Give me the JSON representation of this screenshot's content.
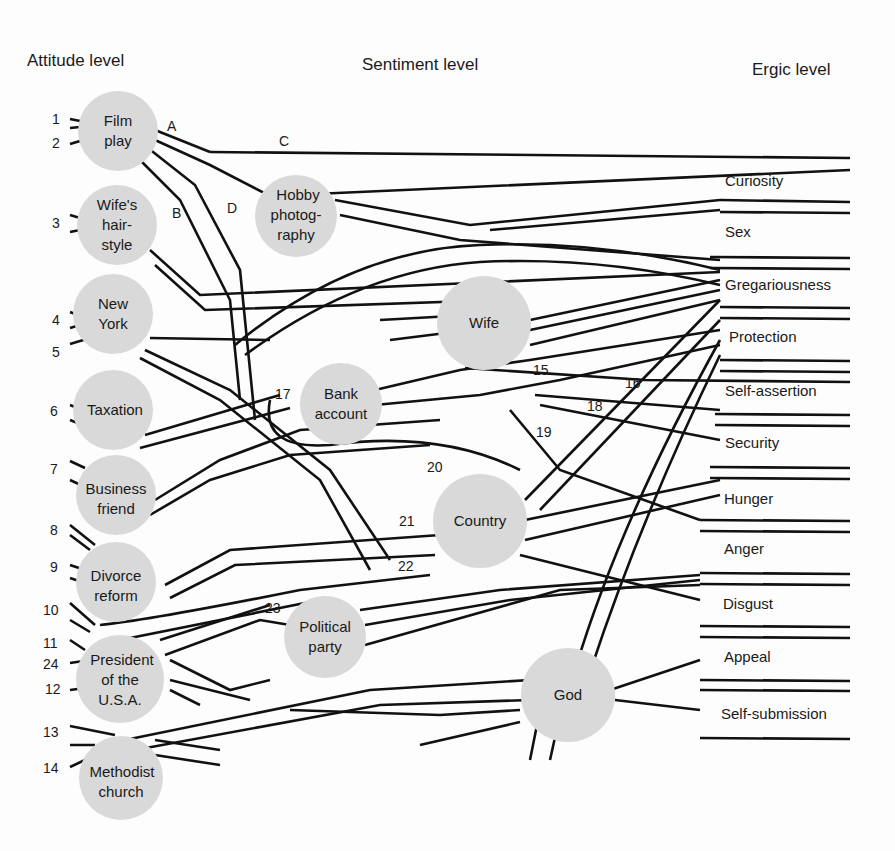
{
  "headers": {
    "attitude": "Attitude level",
    "sentiment": "Sentiment level",
    "ergic": "Ergic level"
  },
  "colors": {
    "node_fill": "#d9d9d9",
    "line": "#111111",
    "background": "#fdfdfd"
  },
  "attitudes": [
    {
      "id": "film",
      "lines": [
        "Film",
        "play"
      ],
      "numbers": [
        "1",
        "2"
      ]
    },
    {
      "id": "wifehair",
      "lines": [
        "Wife's",
        "hair-",
        "style"
      ],
      "numbers": [
        "3"
      ]
    },
    {
      "id": "newyork",
      "lines": [
        "New",
        "York"
      ],
      "numbers": [
        "4",
        "5"
      ]
    },
    {
      "id": "taxation",
      "lines": [
        "Taxation"
      ],
      "numbers": [
        "6"
      ]
    },
    {
      "id": "business",
      "lines": [
        "Business",
        "friend"
      ],
      "numbers": [
        "7"
      ]
    },
    {
      "id": "divorce",
      "lines": [
        "Divorce",
        "reform"
      ],
      "numbers": [
        "8",
        "9"
      ]
    },
    {
      "id": "president",
      "lines": [
        "President",
        "of the",
        "U.S.A."
      ],
      "numbers": [
        "10",
        "11",
        "24",
        "12"
      ]
    },
    {
      "id": "methodist",
      "lines": [
        "Methodist",
        "church"
      ],
      "numbers": [
        "13",
        "14"
      ]
    }
  ],
  "sentiments": [
    {
      "id": "hobby",
      "lines": [
        "Hobby",
        "photog-",
        "raphy"
      ]
    },
    {
      "id": "bank",
      "lines": [
        "Bank",
        "account"
      ]
    },
    {
      "id": "wife",
      "lines": [
        "Wife"
      ]
    },
    {
      "id": "country",
      "lines": [
        "Country"
      ]
    },
    {
      "id": "political",
      "lines": [
        "Political",
        "party"
      ]
    },
    {
      "id": "god",
      "lines": [
        "God"
      ]
    }
  ],
  "ergs": [
    "Curiosity",
    "Sex",
    "Gregariousness",
    "Protection",
    "Self-assertion",
    "Security",
    "Hunger",
    "Anger",
    "Disgust",
    "Appeal",
    "Self-submission"
  ],
  "path_letters": [
    "A",
    "B",
    "C",
    "D"
  ],
  "path_numbers": [
    "15",
    "16",
    "17",
    "18",
    "19",
    "20",
    "21",
    "22",
    "23"
  ]
}
